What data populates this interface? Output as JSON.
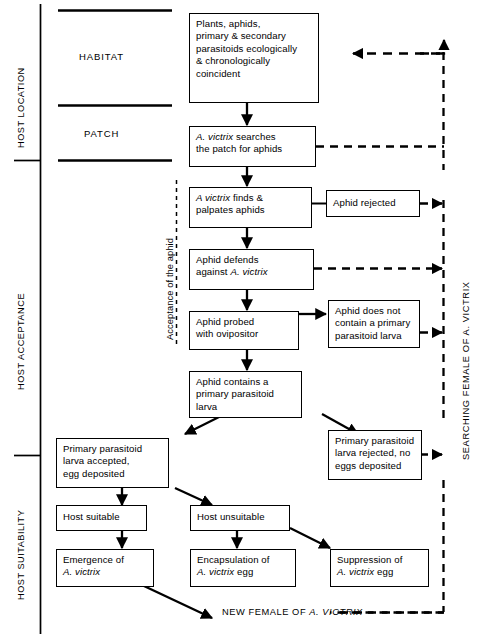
{
  "diagram": {
    "title_bottom": "NEW FEMALE OF A. VICTRIX",
    "stages": [
      {
        "id": "host-location",
        "label": "HOST LOCATION"
      },
      {
        "id": "host-acceptance",
        "label": "HOST ACCEPTANCE"
      },
      {
        "id": "host-suitability",
        "label": "HOST SUITABILITY"
      }
    ],
    "bands": [
      {
        "id": "habitat",
        "label": "HABITAT"
      },
      {
        "id": "patch",
        "label": "PATCH"
      }
    ],
    "bracket_label": "Acceptance of the aphid",
    "loop_label": "SEARCHING FEMALE OF A. VICTRIX",
    "nodes": [
      {
        "id": "plants-aphids",
        "lines": [
          {
            "text": "Plants, aphids,"
          },
          {
            "text": "primary & secondary"
          },
          {
            "text": "parasitoids ecologically"
          },
          {
            "text": "& chronologically"
          },
          {
            "text": "coincident"
          }
        ]
      },
      {
        "id": "victrix-searches",
        "lines": [
          {
            "pre": "A. victrix",
            "text": " searches"
          },
          {
            "text": "the patch for aphids"
          }
        ]
      },
      {
        "id": "victrix-finds",
        "lines": [
          {
            "pre": "A victrix",
            "text": " finds &"
          },
          {
            "text": "palpates aphids"
          }
        ]
      },
      {
        "id": "aphid-rejected",
        "lines": [
          {
            "text": "Aphid rejected"
          }
        ]
      },
      {
        "id": "aphid-defends",
        "lines": [
          {
            "text": "Aphid defends"
          },
          {
            "text": "against ",
            "post": "A. victrix"
          }
        ]
      },
      {
        "id": "aphid-probed",
        "lines": [
          {
            "text": "Aphid probed"
          },
          {
            "text": "with ovipositor"
          }
        ]
      },
      {
        "id": "aphid-no-primary",
        "lines": [
          {
            "text": "Aphid does not"
          },
          {
            "text": "contain a primary"
          },
          {
            "text": "parasitoid larva"
          }
        ]
      },
      {
        "id": "aphid-contains",
        "lines": [
          {
            "text": "Aphid contains a"
          },
          {
            "text": "primary parasitoid"
          },
          {
            "text": "larva"
          }
        ]
      },
      {
        "id": "larva-accepted",
        "lines": [
          {
            "text": "Primary parasitoid"
          },
          {
            "text": "larva accepted,"
          },
          {
            "text": "egg deposited"
          }
        ]
      },
      {
        "id": "larva-rejected",
        "lines": [
          {
            "text": "Primary parasitoid"
          },
          {
            "text": "larva rejected, no"
          },
          {
            "text": "eggs deposited"
          }
        ]
      },
      {
        "id": "host-suitable",
        "lines": [
          {
            "text": "Host suitable"
          }
        ]
      },
      {
        "id": "host-unsuitable",
        "lines": [
          {
            "text": "Host unsuitable"
          }
        ]
      },
      {
        "id": "emergence",
        "lines": [
          {
            "text": "Emergence of"
          },
          {
            "pre": "A. victrix",
            "text": ""
          }
        ]
      },
      {
        "id": "encapsulation",
        "lines": [
          {
            "text": "Encapsulation of"
          },
          {
            "pre": "A. victrix",
            "text": " egg"
          }
        ]
      },
      {
        "id": "suppression",
        "lines": [
          {
            "text": "Suppression of"
          },
          {
            "pre": "A. victrix",
            "text": " egg"
          }
        ]
      }
    ],
    "colors": {
      "ink": "#000000",
      "paper": "#ffffff"
    }
  }
}
